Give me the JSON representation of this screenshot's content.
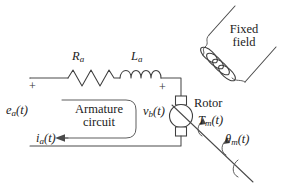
{
  "diagram": {
    "type": "circuit-schematic",
    "stroke_color": "#4a4a4a",
    "text_color": "#1c1c1c",
    "background": "#ffffff",
    "labels": {
      "armature_resistance": "Ra",
      "armature_resistance_base": "R",
      "armature_resistance_sub": "a",
      "armature_inductance_base": "L",
      "armature_inductance_sub": "a",
      "fixed_field_line1": "Fixed",
      "fixed_field_line2": "field",
      "rotor": "Rotor",
      "armature_circuit_line1": "Armature",
      "armature_circuit_line2": "circuit",
      "source_voltage_base": "e",
      "source_voltage_sub": "a",
      "source_voltage_arg": "(t)",
      "back_emf_base": "v",
      "back_emf_sub": "b",
      "back_emf_arg": "(t)",
      "armature_current_base": "i",
      "armature_current_sub": "a",
      "armature_current_arg": "(t)",
      "motor_torque_base": "T",
      "motor_torque_sub": "m",
      "motor_torque_arg": "(t)",
      "angular_position_base": "θ",
      "angular_position_sub": "m",
      "angular_position_arg": "(t)",
      "polarity_plus_source": "+",
      "polarity_plus_rotor": "+"
    },
    "components": [
      {
        "name": "resistor",
        "label": "Ra",
        "peaks": 3
      },
      {
        "name": "inductor",
        "label": "La",
        "loops": 4
      },
      {
        "name": "rotor",
        "label": "Rotor",
        "shape": "circle"
      },
      {
        "name": "field-coil",
        "label": "Fixed field",
        "loops": 5
      },
      {
        "name": "brush-top",
        "shape": "square"
      },
      {
        "name": "brush-bottom",
        "shape": "square"
      },
      {
        "name": "shaft",
        "shape": "line"
      }
    ]
  }
}
